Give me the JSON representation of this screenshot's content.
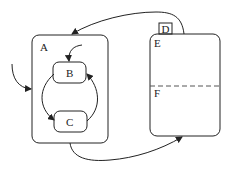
{
  "diagram": {
    "type": "statechart",
    "states": {
      "A": {
        "label": "A",
        "kind": "composite"
      },
      "B": {
        "label": "B",
        "kind": "substate",
        "parent": "A"
      },
      "C": {
        "label": "C",
        "kind": "substate",
        "parent": "A"
      },
      "D": {
        "label": "D",
        "kind": "tab-label"
      },
      "E": {
        "label": "E",
        "kind": "orthogonal-region"
      },
      "F": {
        "label": "F",
        "kind": "orthogonal-region"
      }
    },
    "transitions": [
      {
        "from": "external",
        "to": "A"
      },
      {
        "from": "default",
        "to": "B"
      },
      {
        "from": "B",
        "to": "C"
      },
      {
        "from": "C",
        "to": "B"
      },
      {
        "from": "D",
        "to": "A"
      },
      {
        "from": "A",
        "to": "D"
      }
    ],
    "colors": {
      "stroke": "#222222",
      "background": "#ffffff",
      "divider": "#555555"
    }
  }
}
